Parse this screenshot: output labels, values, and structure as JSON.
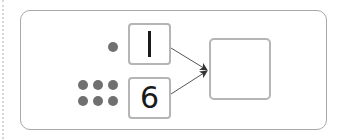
{
  "diagram": {
    "type": "number-bond-addition",
    "inputs": [
      {
        "value": "1",
        "dot_count": 1
      },
      {
        "value": "6",
        "dot_count": 6
      }
    ],
    "result": {
      "value": ""
    },
    "colors": {
      "dot": "#707070",
      "box_border": "#b5b5b5",
      "outer_border": "#a8a8a8",
      "arrow": "#444444",
      "digit": "#1a1a1a"
    }
  }
}
